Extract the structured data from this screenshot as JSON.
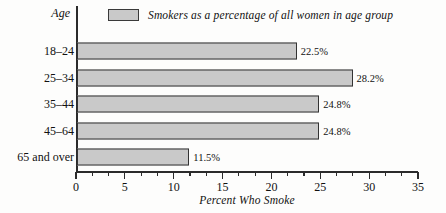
{
  "chart_data": {
    "type": "bar",
    "orientation": "horizontal",
    "title": "",
    "xlabel": "Percent Who Smoke",
    "ylabel": "Age",
    "categories": [
      "18–24",
      "25–34",
      "35–44",
      "45–64",
      "65 and over"
    ],
    "values": [
      22.5,
      28.2,
      24.8,
      24.8,
      11.5
    ],
    "value_labels": [
      "22.5%",
      "28.2%",
      "24.8%",
      "24.8%",
      "11.5%"
    ],
    "series": [
      {
        "name": "Smokers as a percentage of all women in age group",
        "values": [
          22.5,
          28.2,
          24.8,
          24.8,
          11.5
        ]
      }
    ],
    "xlim": [
      0,
      35
    ],
    "xticks": [
      0,
      5,
      10,
      15,
      20,
      25,
      30,
      35
    ],
    "xtick_labels": [
      "0",
      "5",
      "10",
      "15",
      "20",
      "25",
      "30",
      "35"
    ],
    "minor_ticks_per_interval": 2,
    "grid": false,
    "legend": {
      "position": "top",
      "entries": [
        "Smokers as a percentage of all women in age group"
      ]
    },
    "colors": {
      "bar_fill": "#c9c9c9",
      "bar_border": "#333333",
      "axis": "#2b2b2b",
      "text": "#111111",
      "background": "#fdfdfc"
    }
  },
  "axis_title": {
    "y": "Age"
  },
  "caption": {
    "x": "Percent Who Smoke"
  }
}
